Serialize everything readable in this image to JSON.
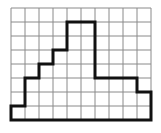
{
  "diagram": {
    "type": "grid-staircase-shape",
    "grid": {
      "columns": 10,
      "rows": 8,
      "origin_x": 11,
      "origin_y": 8,
      "cell_size": 14,
      "line_color": "#8a8a8a",
      "background": "#ffffff"
    },
    "outline": {
      "stroke_color": "#111111",
      "stroke_width": 3,
      "points_cells": [
        [
          0,
          8
        ],
        [
          0,
          7
        ],
        [
          1,
          7
        ],
        [
          1,
          5
        ],
        [
          2,
          5
        ],
        [
          2,
          4
        ],
        [
          3,
          4
        ],
        [
          3,
          3
        ],
        [
          4,
          3
        ],
        [
          4,
          1
        ],
        [
          6,
          1
        ],
        [
          6,
          5
        ],
        [
          9,
          5
        ],
        [
          9,
          6
        ],
        [
          10,
          6
        ],
        [
          10,
          8
        ]
      ]
    }
  }
}
